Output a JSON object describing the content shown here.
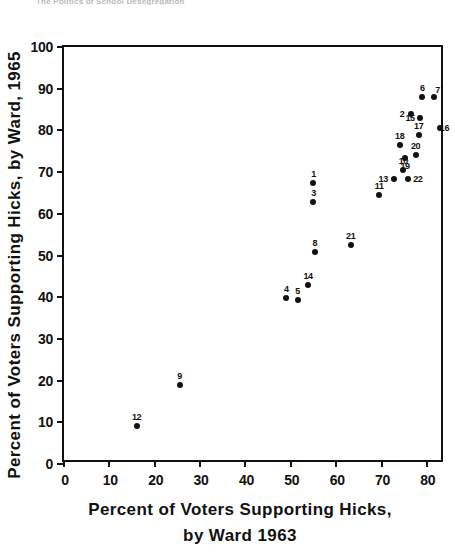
{
  "page": {
    "header_text": "The Politics of School Desegregation"
  },
  "chart_data": {
    "type": "scatter",
    "title": "",
    "xlabel_line1": "Percent of Voters Supporting Hicks,",
    "xlabel_line2": "by Ward 1963",
    "ylabel": "Percent of Voters Supporting Hicks, by Ward, 1965",
    "xlim": [
      0,
      84
    ],
    "ylim": [
      0,
      100
    ],
    "xticks": [
      0,
      10,
      20,
      30,
      40,
      50,
      60,
      70,
      80
    ],
    "xtick_labels": [
      "0",
      "10",
      "20",
      "30",
      "40",
      "50",
      "60",
      "70",
      "80"
    ],
    "yticks": [
      0,
      10,
      20,
      30,
      40,
      50,
      60,
      70,
      80,
      90,
      100
    ],
    "ytick_labels": [
      "0",
      "10",
      "20",
      "30",
      "40",
      "50",
      "60",
      "70",
      "80",
      "90",
      "100"
    ],
    "grid": false,
    "legend": "none",
    "marker_color": "#111111",
    "axis_color": "#111111",
    "points": [
      {
        "label": "1",
        "x": 55.0,
        "y": 67.5,
        "label_dx": 0,
        "label_dy": -9
      },
      {
        "label": "2",
        "x": 76.5,
        "y": 84.0,
        "label_dx": -9,
        "label_dy": 0
      },
      {
        "label": "3",
        "x": 55.0,
        "y": 62.8,
        "label_dx": 0,
        "label_dy": -9
      },
      {
        "label": "4",
        "x": 49.0,
        "y": 39.9,
        "label_dx": 0,
        "label_dy": -9
      },
      {
        "label": "5",
        "x": 51.5,
        "y": 39.4,
        "label_dx": 0,
        "label_dy": -9
      },
      {
        "label": "6",
        "x": 79.0,
        "y": 88.0,
        "label_dx": 0,
        "label_dy": -9
      },
      {
        "label": "7",
        "x": 81.5,
        "y": 88.0,
        "label_dx": 4,
        "label_dy": -7
      },
      {
        "label": "8",
        "x": 55.3,
        "y": 50.8,
        "label_dx": 0,
        "label_dy": -9
      },
      {
        "label": "9",
        "x": 25.5,
        "y": 18.9,
        "label_dx": 0,
        "label_dy": -9
      },
      {
        "label": "10",
        "x": 74.8,
        "y": 70.5,
        "label_dx": 0,
        "label_dy": -9
      },
      {
        "label": "11",
        "x": 69.5,
        "y": 64.5,
        "label_dx": 0,
        "label_dy": -9
      },
      {
        "label": "12",
        "x": 16.0,
        "y": 9.0,
        "label_dx": 0,
        "label_dy": -9
      },
      {
        "label": "13",
        "x": 72.8,
        "y": 68.3,
        "label_dx": -11,
        "label_dy": 0
      },
      {
        "label": "14",
        "x": 53.8,
        "y": 43.0,
        "label_dx": 0,
        "label_dy": -9
      },
      {
        "label": "15",
        "x": 78.5,
        "y": 83.0,
        "label_dx": -10,
        "label_dy": 0
      },
      {
        "label": "16",
        "x": 83.0,
        "y": 80.5,
        "label_dx": 4,
        "label_dy": 0
      },
      {
        "label": "17",
        "x": 78.2,
        "y": 79.0,
        "label_dx": 0,
        "label_dy": -9
      },
      {
        "label": "18",
        "x": 74.0,
        "y": 76.5,
        "label_dx": 0,
        "label_dy": -9
      },
      {
        "label": "19",
        "x": 75.2,
        "y": 73.5,
        "label_dx": 0,
        "label_dy": 8
      },
      {
        "label": "20",
        "x": 77.5,
        "y": 74.0,
        "label_dx": 0,
        "label_dy": -9
      },
      {
        "label": "21",
        "x": 63.2,
        "y": 52.5,
        "label_dx": 0,
        "label_dy": -9
      },
      {
        "label": "22",
        "x": 75.8,
        "y": 68.3,
        "label_dx": 10,
        "label_dy": 0
      }
    ]
  }
}
